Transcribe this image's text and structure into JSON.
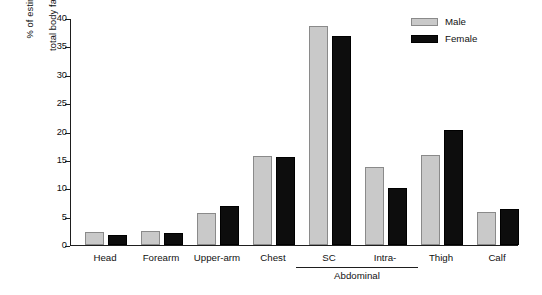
{
  "chart_data": {
    "type": "bar",
    "title": "",
    "xlabel": "",
    "ylabel": "% of estimated\ntotal body fat volume",
    "ylim": [
      0,
      40
    ],
    "yticks": [
      0,
      5,
      10,
      15,
      20,
      25,
      30,
      35,
      40
    ],
    "grid": false,
    "legend_position": "top-right",
    "categories": [
      "Head",
      "Forearm",
      "Upper-arm",
      "Chest",
      "SC",
      "Intra-",
      "Thigh",
      "Calf"
    ],
    "group_annotations": [
      {
        "label": "Abdominal",
        "covers": [
          "SC",
          "Intra-"
        ]
      }
    ],
    "series": [
      {
        "name": "Male",
        "color": "#c9c9c9",
        "values": [
          2.3,
          2.4,
          5.6,
          15.6,
          38.6,
          13.8,
          15.8,
          5.8
        ]
      },
      {
        "name": "Female",
        "color": "#0d0d0d",
        "values": [
          1.8,
          2.1,
          6.9,
          15.5,
          36.8,
          10.0,
          20.3,
          6.4
        ]
      }
    ]
  },
  "legend": {
    "items": [
      {
        "label": "Male"
      },
      {
        "label": "Female"
      }
    ]
  },
  "axis": {
    "y_label_line1": "% of estimated",
    "y_label_line2": "total body fat volume"
  }
}
